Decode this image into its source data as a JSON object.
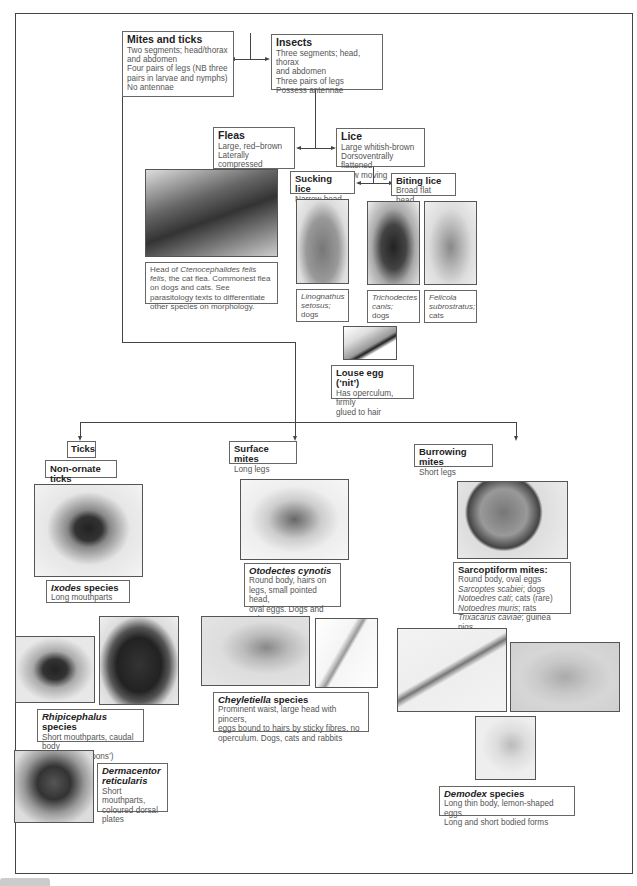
{
  "diagram": {
    "mites_ticks": {
      "title": "Mites and ticks",
      "lines": [
        "Two segments; head/thorax",
        "and abdomen",
        "Four pairs of legs (NB three",
        "pairs in larvae and nymphs)",
        "No antennae"
      ]
    },
    "insects": {
      "title": "Insects",
      "lines": [
        "Three segments; head, thorax",
        "and abdomen",
        "Three pairs of legs",
        "Possess antennae"
      ]
    },
    "fleas": {
      "title": "Fleas",
      "lines": [
        "Large, red–brown",
        "Laterally compressed",
        "Fast moving"
      ]
    },
    "lice": {
      "title": "Lice",
      "lines": [
        "Large whitish-brown",
        "Dorsoventrally flattened",
        "Slow moving"
      ]
    },
    "sucking_lice": {
      "title": "Sucking lice",
      "line": "Narrow head"
    },
    "biting_lice": {
      "title": "Biting lice",
      "line": "Broad flat head"
    },
    "flea_caption": {
      "pre": "Head of ",
      "species": "Ctenocephalides felis felis",
      "post": ", the cat flea. Commonest flea on dogs and cats. See parasitology texts to differentiate other species on morphology."
    },
    "lice_photos": [
      {
        "species": "Linognathus setosus;",
        "host": "dogs"
      },
      {
        "species": "Trichodectes canis;",
        "host": "dogs"
      },
      {
        "species": "Felicola subrostratus;",
        "host": "cats"
      }
    ],
    "louse_egg": {
      "title": "Louse egg (‘nit’)",
      "lines": [
        "Has operculum, firmly",
        "glued to hair"
      ]
    },
    "ticks": {
      "title": "Ticks"
    },
    "non_ornate_ticks": {
      "title": "Non-ornate ticks"
    },
    "surface_mites": {
      "title": "Surface mites",
      "line": "Long legs"
    },
    "burrowing_mites": {
      "title": "Burrowing mites",
      "line": "Short legs"
    },
    "ixodes": {
      "species": "Ixodes",
      "suffix": " species",
      "line": "Long mouthparts"
    },
    "rhipicephalus": {
      "species": "Rhipicephalus",
      "suffix": " species",
      "lines": [
        "Short mouthparts, caudal body",
        "notched (‘festoons’)"
      ]
    },
    "dermacentor": {
      "species1": "Dermacentor",
      "species2": "reticularis",
      "lines": [
        "Short mouthparts,",
        "coloured dorsal",
        "plates"
      ]
    },
    "otodectes": {
      "species": "Otodectes cynotis",
      "lines": [
        "Round body, hairs on",
        "legs, small pointed head,",
        "oval eggs. Dogs and cats"
      ]
    },
    "cheyletiella": {
      "species": "Cheyletiella",
      "suffix": " species",
      "lines": [
        "Prominent waist, large head with pincers,",
        "eggs bound to hairs by sticky fibres, no",
        "operculum. Dogs, cats and rabbits"
      ]
    },
    "sarcoptiform": {
      "title": "Sarcoptiform mites:",
      "line": "Round body, oval eggs",
      "items": [
        {
          "species": "Sarcoptes scabiei",
          "host": "; dogs"
        },
        {
          "species": "Notoedres cati",
          "host": "; cats (rare)"
        },
        {
          "species": "Notoedres muris",
          "host": "; rats"
        },
        {
          "species": "Trixacarus caviae",
          "host": "; guinea pigs"
        }
      ]
    },
    "demodex": {
      "species": "Demodex",
      "suffix": " species",
      "lines": [
        "Long thin body, lemon-shaped eggs.",
        "Long and short bodied forms"
      ]
    }
  }
}
